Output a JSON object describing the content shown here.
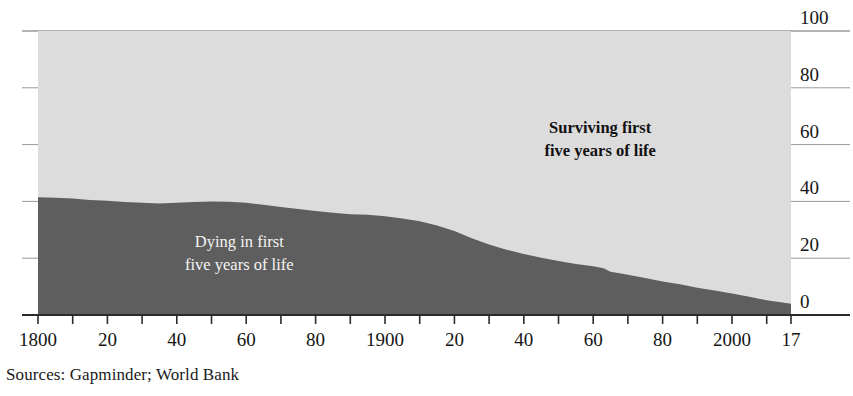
{
  "chart_data": {
    "type": "area",
    "title": "",
    "subtitle": "",
    "xlabel": "",
    "ylabel": "",
    "xlim": [
      1800,
      2017
    ],
    "ylim": [
      0,
      100
    ],
    "grid": true,
    "legend_position": "inline-annotation",
    "y_ticks": [
      100,
      80,
      60,
      40,
      20,
      0
    ],
    "y_tick_labels": [
      "100",
      "80",
      "60",
      "40",
      "20",
      "0"
    ],
    "x_ticks": [
      1800,
      1810,
      1820,
      1830,
      1840,
      1850,
      1860,
      1870,
      1880,
      1890,
      1900,
      1910,
      1920,
      1930,
      1940,
      1950,
      1960,
      1970,
      1980,
      1990,
      2000,
      2010,
      2017
    ],
    "x_tick_labels": [
      {
        "value": 1800,
        "label": "1800"
      },
      {
        "value": 1810,
        "label": ""
      },
      {
        "value": 1820,
        "label": "20"
      },
      {
        "value": 1830,
        "label": ""
      },
      {
        "value": 1840,
        "label": "40"
      },
      {
        "value": 1850,
        "label": ""
      },
      {
        "value": 1860,
        "label": "60"
      },
      {
        "value": 1870,
        "label": ""
      },
      {
        "value": 1880,
        "label": "80"
      },
      {
        "value": 1890,
        "label": ""
      },
      {
        "value": 1900,
        "label": "1900"
      },
      {
        "value": 1910,
        "label": ""
      },
      {
        "value": 1920,
        "label": "20"
      },
      {
        "value": 1930,
        "label": ""
      },
      {
        "value": 1940,
        "label": "40"
      },
      {
        "value": 1950,
        "label": ""
      },
      {
        "value": 1960,
        "label": "60"
      },
      {
        "value": 1970,
        "label": ""
      },
      {
        "value": 1980,
        "label": "80"
      },
      {
        "value": 1990,
        "label": ""
      },
      {
        "value": 2000,
        "label": "2000"
      },
      {
        "value": 2010,
        "label": ""
      },
      {
        "value": 2017,
        "label": "17"
      }
    ],
    "x": [
      1800,
      1805,
      1810,
      1815,
      1820,
      1825,
      1830,
      1835,
      1840,
      1845,
      1850,
      1855,
      1860,
      1865,
      1870,
      1875,
      1880,
      1885,
      1890,
      1895,
      1900,
      1905,
      1910,
      1915,
      1920,
      1925,
      1930,
      1935,
      1940,
      1945,
      1950,
      1955,
      1960,
      1963,
      1965,
      1968,
      1970,
      1975,
      1980,
      1985,
      1990,
      1995,
      2000,
      2005,
      2010,
      2017
    ],
    "series": [
      {
        "name": "Dying in first five years of life",
        "color": "#5e5e5e",
        "values": [
          41.5,
          41.3,
          41.0,
          40.5,
          40.2,
          39.8,
          39.5,
          39.3,
          39.5,
          39.8,
          40.0,
          39.9,
          39.5,
          38.8,
          38.0,
          37.3,
          36.6,
          36.0,
          35.5,
          35.3,
          34.8,
          34.0,
          33.0,
          31.5,
          29.6,
          27.0,
          24.8,
          23.0,
          21.5,
          20.2,
          19.0,
          18.0,
          17.2,
          16.5,
          15.2,
          14.6,
          14.2,
          13.0,
          11.8,
          10.8,
          9.6,
          8.6,
          7.6,
          6.4,
          5.2,
          4.0
        ]
      },
      {
        "name": "Surviving first five years of life",
        "color": "#dcdcdc",
        "values": [
          58.5,
          58.7,
          59.0,
          59.5,
          59.8,
          60.2,
          60.5,
          60.7,
          60.5,
          60.2,
          60.0,
          60.1,
          60.5,
          61.2,
          62.0,
          62.7,
          63.4,
          64.0,
          64.5,
          64.7,
          65.2,
          66.0,
          67.0,
          68.5,
          70.4,
          73.0,
          75.2,
          77.0,
          78.5,
          79.8,
          81.0,
          82.0,
          82.8,
          83.5,
          84.8,
          85.4,
          85.8,
          87.0,
          88.2,
          89.2,
          90.4,
          91.4,
          92.4,
          93.6,
          94.8,
          96.0
        ]
      }
    ],
    "annotations": [
      {
        "name": "surviving-label",
        "lines": [
          "Surviving first",
          "five years of life"
        ],
        "x": 1962,
        "y": 64,
        "on": "light"
      },
      {
        "name": "dying-label",
        "lines": [
          "Dying in first",
          "five years of life"
        ],
        "x": 1858,
        "y": 24,
        "on": "dark"
      }
    ],
    "source_note": "Sources: Gapminder; World Bank"
  },
  "colors": {
    "dying_fill": "#5e5e5e",
    "surviving_fill": "#dcdcdc",
    "gridline": "#9a9a9a",
    "axis": "#2b2b2b",
    "text": "#151515",
    "label_on_dark": "#f4f4f4"
  }
}
